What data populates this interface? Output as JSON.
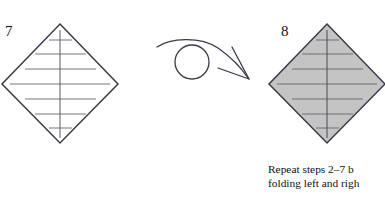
{
  "page": {
    "background_color": "#ffffff",
    "width": 385,
    "height": 197,
    "kind": "origami-instruction-diagram"
  },
  "steps": [
    {
      "number": "7",
      "name": "step-7-figure",
      "shape": "diamond",
      "fill_color": "#ffffff",
      "stroke_color": "#3a3a48",
      "description": "White diamond with seven horizontal crease lines and one vertical center crease",
      "crease_lines": 7,
      "has_vertical_crease": true,
      "geometry": {
        "top": [
          60,
          24
        ],
        "right": [
          118,
          84
        ],
        "bottom": [
          60,
          143
        ],
        "left": [
          2,
          84
        ]
      }
    },
    {
      "number": "8",
      "name": "step-8-figure",
      "shape": "diamond",
      "fill_color": "#c4c4c4",
      "stroke_color": "#3a3a48",
      "description": "Gray shaded diamond with seven horizontal crease lines and one vertical center crease, clipped at right edge",
      "crease_lines": 7,
      "has_vertical_crease": true,
      "geometry": {
        "top": [
          327,
          24
        ],
        "right": [
          385,
          84
        ],
        "bottom": [
          327,
          143
        ],
        "left": [
          269,
          84
        ]
      }
    }
  ],
  "arrow": {
    "name": "flip-over-arrow",
    "type": "turn-over-loop-arrow",
    "color": "#3a3a48",
    "circle_center": [
      192,
      62
    ],
    "circle_radius": 17,
    "direction": "left-to-right",
    "meaning": "turn the model over"
  },
  "caption": {
    "line1": "Repeat steps 2–7 b",
    "line2": "folding left and righ",
    "truncated": true,
    "color": "#111111"
  },
  "colors": {
    "ink": "#3a3a48",
    "text": "#111111",
    "shade_gray": "#c4c4c4",
    "crease_gray": "#77777e",
    "background": "#ffffff"
  }
}
